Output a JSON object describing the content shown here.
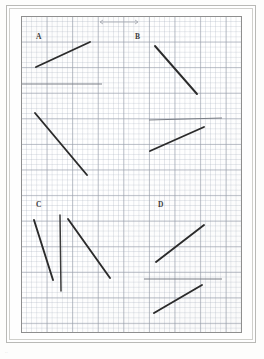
{
  "page": {
    "background_color": "#fdfdfc",
    "border_color": "#b9b9b6",
    "corner_mark": "..",
    "media": "graph-paper-worksheet-scan"
  },
  "grid": {
    "area_x": 21,
    "area_y": 16,
    "width": 221,
    "height": 317,
    "minor_spacing_px": 5.12,
    "major_spacing_px": 25.6,
    "minor_color": "#a8b0be",
    "major_color": "#969ca8",
    "border_color": "#8e8e8e"
  },
  "ink": {
    "dark": "#2b2b2b",
    "mid": "#3a3a3a",
    "faint": "#7b7f86",
    "ghost": "#a9adb4"
  },
  "sections": [
    {
      "id": "A",
      "label": "A",
      "label_x": 14,
      "label_y": 16,
      "segments": [
        {
          "name": "segment-a1",
          "x1": 14,
          "y1": 50,
          "x2": 68,
          "y2": 25,
          "ink": "dark",
          "orientation": "rising"
        },
        {
          "name": "segment-a2",
          "x1": 0,
          "y1": 67,
          "x2": 80,
          "y2": 67,
          "ink": "faint",
          "orientation": "horizontal"
        },
        {
          "name": "segment-a3",
          "x1": 13,
          "y1": 96,
          "x2": 65,
          "y2": 158,
          "ink": "dark",
          "orientation": "falling"
        }
      ]
    },
    {
      "id": "B",
      "label": "B",
      "label_x": 113,
      "label_y": 16,
      "segments": [
        {
          "name": "segment-b1",
          "x1": 133,
          "y1": 29,
          "x2": 175,
          "y2": 77,
          "ink": "dark",
          "orientation": "falling"
        },
        {
          "name": "segment-b2",
          "x1": 127,
          "y1": 103,
          "x2": 200,
          "y2": 101,
          "ink": "faint",
          "orientation": "horizontal"
        },
        {
          "name": "segment-b3",
          "x1": 128,
          "y1": 134,
          "x2": 182,
          "y2": 110,
          "ink": "dark",
          "orientation": "rising"
        }
      ]
    },
    {
      "id": "C",
      "label": "C",
      "label_x": 14,
      "label_y": 184,
      "segments": [
        {
          "name": "segment-c1",
          "x1": 12,
          "y1": 203,
          "x2": 31,
          "y2": 263,
          "ink": "dark",
          "orientation": "falling-steep"
        },
        {
          "name": "segment-c2",
          "x1": 38,
          "y1": 198,
          "x2": 39,
          "y2": 274,
          "ink": "mid",
          "orientation": "vertical"
        },
        {
          "name": "segment-c3",
          "x1": 46,
          "y1": 202,
          "x2": 88,
          "y2": 261,
          "ink": "dark",
          "orientation": "falling"
        }
      ]
    },
    {
      "id": "D",
      "label": "D",
      "label_x": 136,
      "label_y": 184,
      "segments": [
        {
          "name": "segment-d1",
          "x1": 134,
          "y1": 245,
          "x2": 182,
          "y2": 208,
          "ink": "dark",
          "orientation": "rising"
        },
        {
          "name": "segment-d2",
          "x1": 122,
          "y1": 262,
          "x2": 200,
          "y2": 262,
          "ink": "faint",
          "orientation": "horizontal"
        },
        {
          "name": "segment-d3",
          "x1": 132,
          "y1": 296,
          "x2": 180,
          "y2": 268,
          "ink": "dark",
          "orientation": "rising"
        }
      ]
    }
  ],
  "annotation": {
    "name": "scale-arrow-annotation",
    "description": "faint pencil double-arrow measurement mark near top edge",
    "x1": 78,
    "y1": 5,
    "x2": 116,
    "y2": 5,
    "ink": "ghost"
  }
}
